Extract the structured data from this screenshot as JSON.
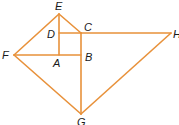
{
  "diagram": {
    "stroke_color": "#E8913A",
    "label_color": "#1a1a1a",
    "points": {
      "E": {
        "x": 59,
        "y": 14
      },
      "C": {
        "x": 81,
        "y": 33
      },
      "D": {
        "x": 59,
        "y": 33
      },
      "H": {
        "x": 171,
        "y": 33
      },
      "F": {
        "x": 14,
        "y": 55
      },
      "A": {
        "x": 59,
        "y": 55
      },
      "B": {
        "x": 81,
        "y": 55
      },
      "G": {
        "x": 81,
        "y": 114
      }
    },
    "segments": [
      [
        "E",
        "C"
      ],
      [
        "E",
        "A"
      ],
      [
        "E",
        "F"
      ],
      [
        "D",
        "C"
      ],
      [
        "C",
        "H"
      ],
      [
        "C",
        "G"
      ],
      [
        "F",
        "B"
      ],
      [
        "F",
        "G"
      ],
      [
        "G",
        "H"
      ]
    ],
    "labels": [
      {
        "text": "E",
        "x": 55,
        "y": 10
      },
      {
        "text": "C",
        "x": 84,
        "y": 31
      },
      {
        "text": "D",
        "x": 47,
        "y": 38
      },
      {
        "text": "H",
        "x": 173,
        "y": 38
      },
      {
        "text": "F",
        "x": 2,
        "y": 59
      },
      {
        "text": "A",
        "x": 53,
        "y": 67
      },
      {
        "text": "B",
        "x": 85,
        "y": 61
      },
      {
        "text": "G",
        "x": 77,
        "y": 126
      }
    ]
  }
}
